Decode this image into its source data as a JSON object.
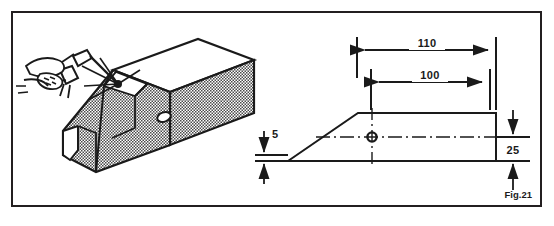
{
  "figure": {
    "caption": "Fig.21",
    "border_color": "#231f20",
    "background_color": "#ffffff",
    "line_color": "#1a1a1a",
    "hatch_color": "#8a8a8a"
  },
  "isometric_view": {
    "name": "welding-illustration",
    "description": "Hand holding welding torch welding a chamfered U-channel beam",
    "parts": [
      {
        "name": "hand",
        "label": "hand"
      },
      {
        "name": "welding-torch",
        "label": "welding torch"
      },
      {
        "name": "torch-cable",
        "label": "cable"
      },
      {
        "name": "weld-arc",
        "label": "arc"
      },
      {
        "name": "channel-beam",
        "label": "U-channel beam"
      },
      {
        "name": "beam-hole",
        "label": "hole"
      }
    ]
  },
  "orthographic_view": {
    "name": "side-view-drawing",
    "dimensions": [
      {
        "id": "overall-length",
        "value": "110",
        "orientation": "horizontal"
      },
      {
        "id": "hole-to-end-length",
        "value": "100",
        "orientation": "horizontal"
      },
      {
        "id": "height",
        "value": "25",
        "orientation": "vertical"
      },
      {
        "id": "thickness",
        "value": "5",
        "orientation": "vertical"
      }
    ],
    "features": [
      {
        "name": "centerline",
        "label": "centreline"
      },
      {
        "name": "hole-center-mark",
        "label": "hole centre"
      },
      {
        "name": "chamfer-edge",
        "label": "chamfer"
      }
    ]
  }
}
